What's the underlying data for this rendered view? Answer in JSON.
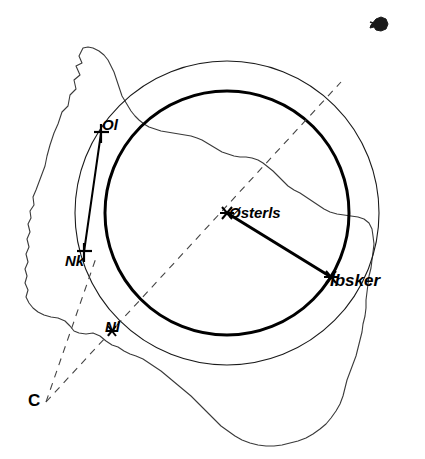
{
  "figure": {
    "background_color": "#ffffff",
    "line_color": "#000000",
    "width": 425,
    "height": 459
  },
  "labels": {
    "ol": "Ol",
    "nk": "Nk",
    "nl": "Nl",
    "center": "Østerls",
    "ibsker": "Ibsker",
    "c": "C"
  },
  "markers": {
    "ol": {
      "label": "Ol",
      "glyph": "cross-marker",
      "x": 101,
      "y": 133
    },
    "nk": {
      "label": "Nk",
      "glyph": "cross-marker",
      "x": 83,
      "y": 252
    },
    "nl": {
      "label": "Nl",
      "glyph": "asterisk-marker",
      "x": 113,
      "y": 331
    },
    "center": {
      "label": "Østerls",
      "glyph": "asterisk-marker",
      "x": 227,
      "y": 213
    },
    "ibsker": {
      "label": "Ibsker",
      "glyph": "asterisk-marker",
      "x": 331,
      "y": 277
    },
    "c": {
      "label": "C",
      "glyph": "none",
      "x": 46,
      "y": 402
    }
  },
  "geometry": {
    "circles": [
      {
        "name": "outer-circle",
        "cx": 227,
        "cy": 213,
        "r": 152,
        "stroke_width": 1.1,
        "style": "thin"
      },
      {
        "name": "inner-circle",
        "cx": 227,
        "cy": 213,
        "r": 122,
        "stroke_width": 3.0,
        "style": "thick"
      }
    ],
    "radius_line": {
      "name": "center-to-ibsker",
      "x1": 227,
      "y1": 213,
      "x2": 331,
      "y2": 277,
      "stroke_width": 3.0
    },
    "chord_line": {
      "name": "ol-to-nk",
      "x1": 101,
      "y1": 133,
      "x2": 83,
      "y2": 252,
      "stroke_width": 2.0
    },
    "dashed_lines": [
      {
        "name": "dashed-c-to-northeast",
        "x1": 46,
        "y1": 402,
        "x2": 341,
        "y2": 82
      },
      {
        "name": "dashed-c-to-nk",
        "x1": 46,
        "y1": 402,
        "x2": 95,
        "y2": 262
      }
    ]
  },
  "island_glyph": {
    "name": "small-island",
    "x": 375,
    "y": 20
  },
  "coastline": {
    "name": "bornholm-coastline",
    "closed": true
  }
}
